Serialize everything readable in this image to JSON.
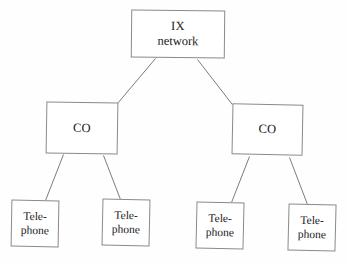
{
  "diagram": {
    "background_color": "#fefefe",
    "stroke_color": "#8a8a8a",
    "text_color": "#1a1a1a",
    "nodes": {
      "root": {
        "id": "ix-network",
        "line_1": "IX",
        "line_2": "network"
      },
      "co_left": {
        "id": "co-left",
        "label": "CO"
      },
      "co_right": {
        "id": "co-right",
        "label": "CO"
      },
      "phone_1": {
        "id": "telephone-1",
        "line_1": "Tele-",
        "line_2": "phone"
      },
      "phone_2": {
        "id": "telephone-2",
        "line_1": "Tele-",
        "line_2": "phone"
      },
      "phone_3": {
        "id": "telephone-3",
        "line_1": "Tele-",
        "line_2": "phone"
      },
      "phone_4": {
        "id": "telephone-4",
        "line_1": "Tele-",
        "line_2": "phone"
      }
    },
    "edges": [
      {
        "from": "ix-network",
        "to": "co-left"
      },
      {
        "from": "ix-network",
        "to": "co-right"
      },
      {
        "from": "co-left",
        "to": "telephone-1"
      },
      {
        "from": "co-left",
        "to": "telephone-2"
      },
      {
        "from": "co-right",
        "to": "telephone-3"
      },
      {
        "from": "co-right",
        "to": "telephone-4"
      }
    ]
  }
}
